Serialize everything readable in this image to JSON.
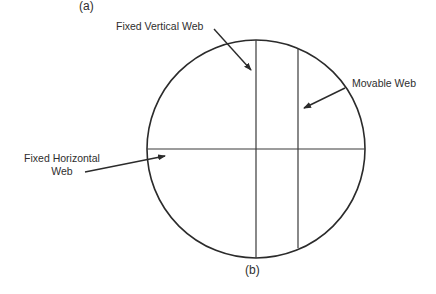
{
  "figure": {
    "caption_top": "(a)",
    "caption_bottom": "(b)",
    "labels": {
      "fixed_vertical_web": "Fixed Vertical Web",
      "movable_web": "Movable Web",
      "fixed_horizontal_web_line1": "Fixed Horizontal",
      "fixed_horizontal_web_line2": "Web"
    },
    "geometry": {
      "circle": {
        "cx": 256,
        "cy": 149,
        "r": 109
      },
      "fixed_vertical_x": 256,
      "movable_vertical_x": 298,
      "horizontal_y": 149
    },
    "stroke_color": "#2b2b2b"
  }
}
